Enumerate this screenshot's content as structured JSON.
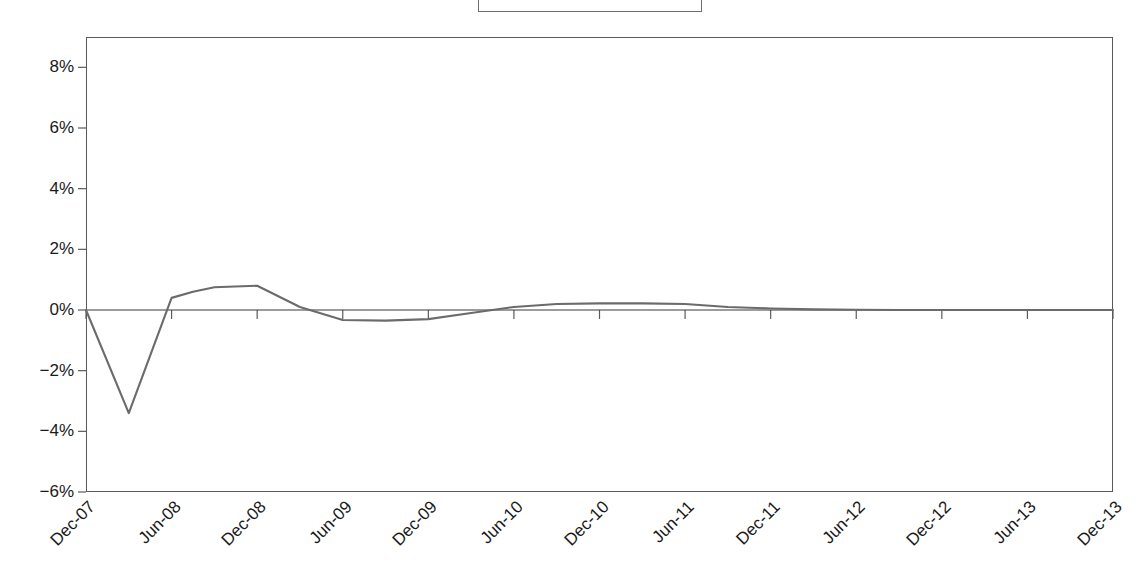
{
  "chart_data": {
    "type": "line",
    "title": "",
    "subtitle": "",
    "xlabel": "",
    "ylabel": "",
    "categories": [
      "Dec-07",
      "Jun-08",
      "Dec-08",
      "Jun-09",
      "Dec-09",
      "Jun-10",
      "Dec-10",
      "Jun-11",
      "Dec-11",
      "Jun-12",
      "Dec-12",
      "Jun-13",
      "Dec-13"
    ],
    "x_tick_labels": [
      "Dec-07",
      "Jun-08",
      "Dec-08",
      "Jun-09",
      "Dec-09",
      "Jun-10",
      "Dec-10",
      "Jun-11",
      "Dec-11",
      "Jun-12",
      "Dec-12",
      "Jun-13",
      "Dec-13"
    ],
    "y_tick_labels": [
      "8%",
      "6%",
      "4%",
      "2%",
      "0%",
      "−2%",
      "−4%",
      "−6%"
    ],
    "y_tick_values": [
      8,
      6,
      4,
      2,
      0,
      -2,
      -4,
      -6
    ],
    "ylim": [
      -6,
      9
    ],
    "xlim": [
      0,
      12
    ],
    "grid": false,
    "legend_position": "top-center",
    "legend_clipped": true,
    "series": [
      {
        "name": "",
        "color": "#6b6b6b",
        "x": [
          0,
          0.5,
          1,
          1.25,
          1.5,
          2,
          2.5,
          3,
          3.5,
          4,
          4.5,
          5,
          5.5,
          6,
          6.5,
          7,
          7.5,
          8,
          8.5,
          9,
          9.5,
          10,
          10.5,
          11,
          11.5,
          12
        ],
        "values": [
          0.0,
          -3.4,
          0.4,
          0.6,
          0.75,
          0.8,
          0.1,
          -0.33,
          -0.35,
          -0.3,
          -0.1,
          0.1,
          0.2,
          0.22,
          0.22,
          0.2,
          0.1,
          0.05,
          0.02,
          0.01,
          0.0,
          0.0,
          0.0,
          0.0,
          0.0,
          0.0
        ]
      }
    ],
    "annotations": {
      "zero_line": 0,
      "minimum": {
        "label": "Mar-08",
        "value": -3.4
      },
      "maximum": {
        "label": "Dec-08",
        "value": 0.8
      }
    }
  },
  "legend": {
    "entries": [
      {
        "label": "",
        "color": "#6b6b6b"
      }
    ]
  },
  "colors": {
    "series_line": "#6b6b6b",
    "axis": "#5a5a5a",
    "zero_axis": "#3a3a3a",
    "text": "#1a1a1a",
    "background": "#ffffff"
  }
}
